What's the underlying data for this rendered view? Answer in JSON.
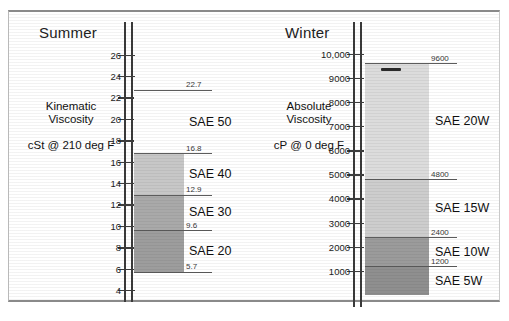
{
  "figure": {
    "background": "#ffffff",
    "frame_color": "#8a8a8a"
  },
  "panels": {
    "summer": {
      "title": "Summer",
      "desc_line1": "Kinematic",
      "desc_line2": "Viscosity",
      "unit": "cSt @ 210 deg F"
    },
    "winter": {
      "title": "Winter",
      "desc_line1": "Absolute",
      "desc_line2": "Viscosity",
      "unit": "cP @ 0 deg F"
    }
  },
  "chart_data": [
    {
      "type": "bar",
      "id": "summer",
      "title": "Summer",
      "ylabel": "Kinematic Viscosity",
      "unit": "cSt @ 210 deg F",
      "ylim": [
        4,
        27
      ],
      "grid": false,
      "legend": "none",
      "axis_ticks": [
        4,
        6,
        8,
        10,
        12,
        14,
        16,
        18,
        20,
        22,
        24,
        26
      ],
      "axis_tick_labels": [
        "4",
        "6",
        "8",
        "10",
        "12",
        "14",
        "16",
        "18",
        "20",
        "22",
        "24",
        "26"
      ],
      "bands": [
        {
          "label": "SAE 20",
          "min": 5.7,
          "max": 9.6,
          "color": "#9d9d9d"
        },
        {
          "label": "SAE 30",
          "min": 9.6,
          "max": 12.9,
          "color": "#a9a9a9"
        },
        {
          "label": "SAE 40",
          "min": 12.9,
          "max": 16.8,
          "color": "#c7c7c7"
        },
        {
          "label": "SAE 50",
          "min": 16.8,
          "max": 22.7,
          "color": "#ffffff"
        }
      ],
      "boundary_labels": [
        "5.7",
        "9.6",
        "12.9",
        "16.8",
        "22.7"
      ],
      "boundary_values": [
        5.7,
        9.6,
        12.9,
        16.8,
        22.7
      ]
    },
    {
      "type": "bar",
      "id": "winter",
      "title": "Winter",
      "ylabel": "Absolute Viscosity",
      "unit": "cP @ 0 deg F",
      "ylim": [
        0,
        10400
      ],
      "grid": false,
      "legend": "none",
      "axis_ticks": [
        1000,
        2000,
        3000,
        4000,
        5000,
        6000,
        7000,
        8000,
        9000,
        10000
      ],
      "axis_tick_labels": [
        "1000",
        "2000",
        "3000",
        "4000",
        "5000",
        "6000",
        "7000",
        "8000",
        "9000",
        "10,000"
      ],
      "bands": [
        {
          "label": "SAE 5W",
          "min": 0,
          "max": 1200,
          "color": "#8f8f8f"
        },
        {
          "label": "SAE 10W",
          "min": 1200,
          "max": 2400,
          "color": "#9b9b9b"
        },
        {
          "label": "SAE 15W",
          "min": 2400,
          "max": 4800,
          "color": "#cdcdcd"
        },
        {
          "label": "SAE 20W",
          "min": 4800,
          "max": 9600,
          "color": "#dcdcdc"
        }
      ],
      "boundary_labels": [
        "1200",
        "2400",
        "4800",
        "9600"
      ],
      "boundary_values": [
        1200,
        2400,
        4800,
        9600
      ]
    }
  ]
}
